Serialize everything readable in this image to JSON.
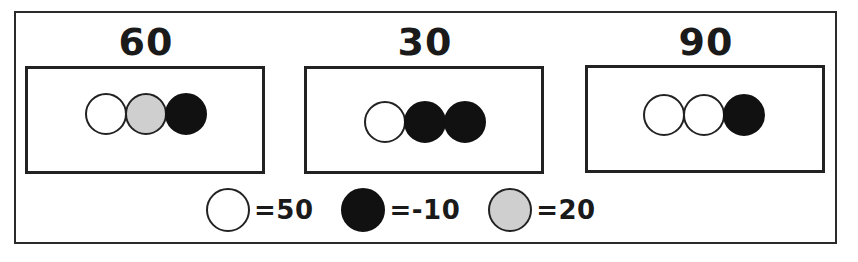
{
  "panels": [
    {
      "value": "60",
      "circles": [
        "white",
        "gray",
        "black"
      ]
    },
    {
      "value": "30",
      "circles": [
        "white",
        "black",
        "black"
      ]
    },
    {
      "value": "90",
      "circles": [
        "white",
        "white",
        "black"
      ]
    }
  ],
  "legend": [
    {
      "color": "white",
      "label": "=50"
    },
    {
      "color": "black",
      "label": "=-10"
    },
    {
      "color": "gray",
      "label": "=20"
    }
  ],
  "colors": {
    "white": "#ffffff",
    "black": "#111111",
    "gray": "#cfcfcf",
    "stroke": "#222222"
  }
}
